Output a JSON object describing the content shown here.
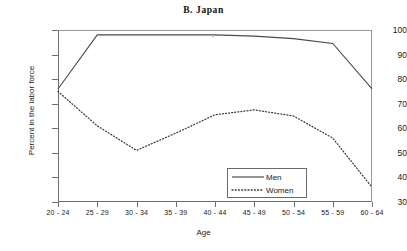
{
  "chart_data": {
    "type": "line",
    "title": "B.  Japan",
    "xlabel": "Age",
    "ylabel": "Percent in the labor force",
    "categories": [
      "20 - 24",
      "25 - 29",
      "30 - 34",
      "35 - 39",
      "40 - 44",
      "45 - 49",
      "50 - 54",
      "55 - 59",
      "60 - 64"
    ],
    "ylim": [
      30,
      100
    ],
    "yticks": [
      30,
      40,
      50,
      60,
      70,
      80,
      90,
      100
    ],
    "ytick_labels": [
      "30",
      "40",
      "50",
      "60",
      "70",
      "80",
      "90",
      "100"
    ],
    "grid": false,
    "legend_position": "inside-lower-right",
    "series": [
      {
        "name": "Men",
        "style": "solid",
        "color": "#4a4a4a",
        "values": [
          76,
          98,
          98,
          98,
          98,
          97.5,
          96.5,
          94.5,
          76
        ]
      },
      {
        "name": "Women",
        "style": "dotted",
        "color": "#3c3c3c",
        "values": [
          75,
          61,
          51,
          58,
          65.5,
          67.5,
          65,
          56,
          36
        ]
      }
    ]
  },
  "legend": {
    "men_label": "Men",
    "women_label": "Women"
  }
}
